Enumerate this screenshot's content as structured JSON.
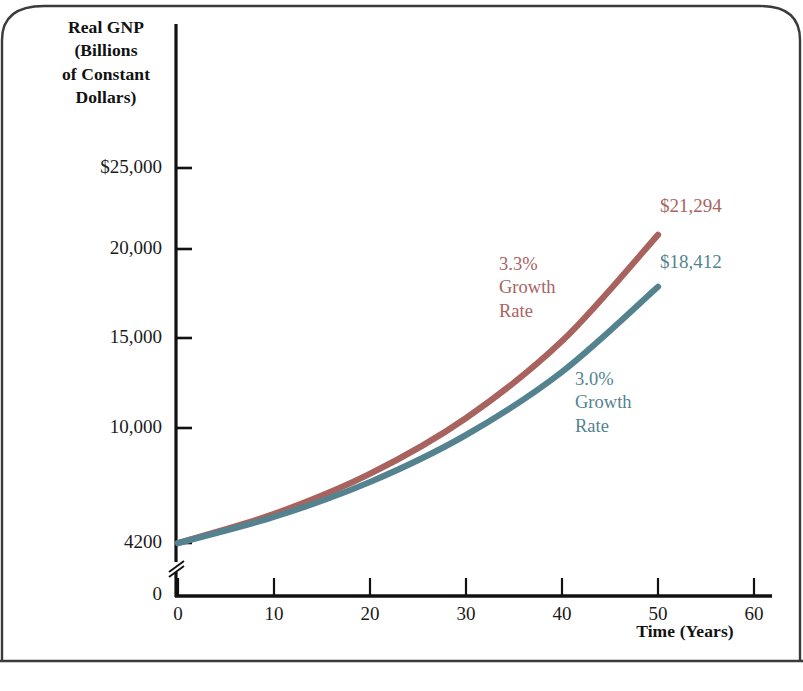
{
  "chart_data": {
    "type": "line",
    "title": "",
    "xlabel": "Time (Years)",
    "ylabel": "Real GNP (Billions of Constant Dollars)",
    "ylabel_lines": [
      "Real GNP",
      "(Billions",
      "of Constant",
      "Dollars)"
    ],
    "x": [
      0,
      10,
      20,
      30,
      40,
      50
    ],
    "xlim": [
      0,
      60
    ],
    "ylim": [
      4200,
      25000
    ],
    "xticks": [
      0,
      10,
      20,
      30,
      40,
      50,
      60
    ],
    "xtick_labels": [
      "0",
      "10",
      "20",
      "30",
      "40",
      "50",
      "60"
    ],
    "yticks": [
      25000,
      20000,
      15000,
      10000,
      4200,
      0
    ],
    "ytick_labels": [
      "$25,000",
      "20,000",
      "15,000",
      "10,000",
      "4200",
      "0"
    ],
    "y_axis_break": true,
    "grid": false,
    "legend_position": "inline-annotations",
    "series": [
      {
        "name": "3.3% Growth Rate",
        "color": "#a9635f",
        "values": [
          4200,
          5810,
          8040,
          11130,
          15400,
          21294
        ],
        "end_label": "$21,294",
        "annotation_lines": [
          "3.3%",
          "Growth",
          "Rate"
        ]
      },
      {
        "name": "3.0% Growth Rate",
        "color": "#54838f",
        "values": [
          4200,
          5645,
          7585,
          10190,
          13690,
          18412
        ],
        "end_label": "$18,412",
        "annotation_lines": [
          "3.0%",
          "Growth",
          "Rate"
        ]
      }
    ]
  },
  "figure": {
    "frame_color": "#3b3b3b",
    "axis_color": "#111111"
  }
}
